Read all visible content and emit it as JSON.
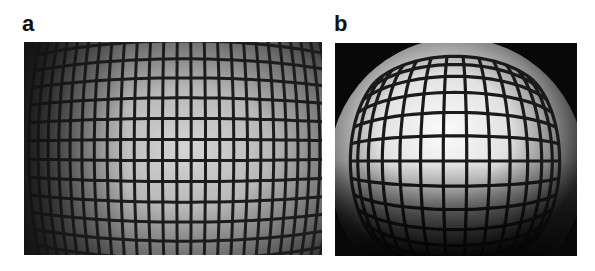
{
  "figure": {
    "panels": [
      {
        "label": "a",
        "description": "grid photographed with wide-field lens showing barrel distortion and vignetting",
        "grid": {
          "vertical_lines": 22,
          "horizontal_lines": 16
        },
        "colors": {
          "background_dark": "#1a1a1a",
          "center_bright": "#d8d8d8",
          "grid_line": "#1c1c1c"
        }
      },
      {
        "label": "b",
        "description": "grid photographed with fisheye lens showing strong barrel distortion within circular field",
        "grid": {
          "vertical_lines": 12,
          "horizontal_lines": 11
        },
        "colors": {
          "background_dark": "#080808",
          "center_bright": "#fafafa",
          "grid_line": "#1a1a1a"
        }
      }
    ]
  }
}
